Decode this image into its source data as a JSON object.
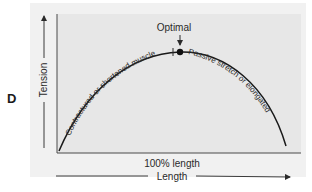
{
  "figure": {
    "panel_label": "D",
    "y_axis_label": "Tension",
    "x_axis_label": "Length",
    "x_marker_label": "100% length",
    "peak_label": "Optimal",
    "left_curve_label": "Contractured or shortened muscle",
    "right_curve_label": "Passive stretch or elongated",
    "colors": {
      "outer_background": "#f1f1f1",
      "plot_background": "#e7e7e7",
      "curve": "#1a1a1a",
      "axis": "#3a3a3a",
      "text": "#2a2a2a"
    }
  }
}
